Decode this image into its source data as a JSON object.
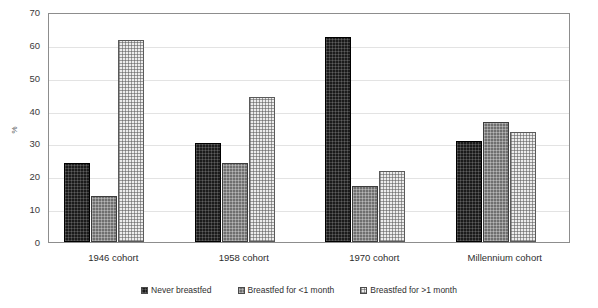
{
  "chart_data": {
    "type": "bar",
    "title": "",
    "xlabel": "",
    "ylabel": "%",
    "ylim": [
      0,
      70
    ],
    "ytick_step": 10,
    "yticks": [
      70,
      60,
      50,
      40,
      30,
      20,
      10,
      0
    ],
    "grid": true,
    "legend_position": "bottom",
    "categories": [
      "1946 cohort",
      "1958 cohort",
      "1970 cohort",
      "Millennium cohort"
    ],
    "series": [
      {
        "name": "Never breastfed",
        "values": [
          24.2,
          30.2,
          62.4,
          30.6
        ]
      },
      {
        "name": "Breastfed for <1 month",
        "values": [
          14.0,
          24.2,
          17.2,
          36.6
        ]
      },
      {
        "name": "Breastfed for >1 month",
        "values": [
          61.4,
          44.2,
          21.6,
          33.6
        ]
      }
    ],
    "colors": [
      "#1b1b1b",
      "#6f6f6f",
      "#ececec"
    ]
  },
  "axis": {
    "y_label": "%"
  },
  "legend": {
    "items": [
      {
        "label": "Never breastfed"
      },
      {
        "label": "Breastfed for <1 month"
      },
      {
        "label": "Breastfed for >1 month"
      }
    ]
  }
}
